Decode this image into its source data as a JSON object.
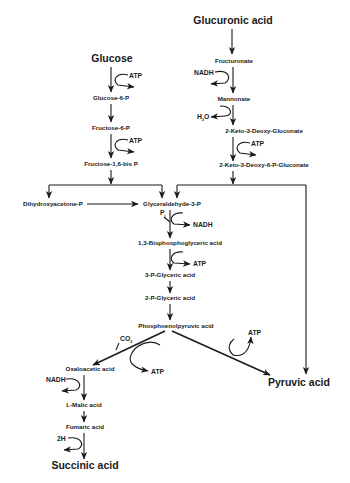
{
  "start_nodes": {
    "glucose": "Glucose",
    "glucuronic_acid": "Glucuronic acid"
  },
  "glycolysis": {
    "glucose_6_p": "Glucose-6-P",
    "fructose_6_p": "Fructose-6-P",
    "fructose_16_bisp": "Fructose-1,6-bis P",
    "dhap": "Dihydroxyacetone-P",
    "g3p": "Glyceraldehyde-3-P",
    "bpg": "1,3-Bisphosphoglyceric acid",
    "pg3": "3-P-Glyceric acid",
    "pg2": "2-P-Glyceric acid",
    "pep": "Phosphoenolpyruvic acid"
  },
  "glucuronate_path": {
    "fructuronate": "Fructuronate",
    "mannonate": "Mannonate",
    "kdg": "2-Keto-3-Deoxy-Gluconate",
    "kdpg": "2-Keto-3-Deoxy-6-P-Gluconate"
  },
  "reductive_branch": {
    "oxaloacetic": "Oxaloacetic acid",
    "malic": "L-Malic acid",
    "fumaric": "Fumaric acid"
  },
  "end_products": {
    "pyruvic": "Pyruvic acid",
    "succinic": "Succinic acid"
  },
  "cofactors": {
    "atp": "ATP",
    "nadh": "NADH",
    "h2o": "H",
    "h2o_sub": "2",
    "h2o_o": "O",
    "pi": "P",
    "pi_sub": "i",
    "co2": "CO",
    "co2_sub": "2",
    "two_h": "2H"
  }
}
